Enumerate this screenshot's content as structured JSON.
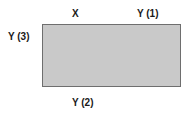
{
  "diagram": {
    "shape": "rectangle",
    "fill_color": "#c9c9c9",
    "border_color": "#6e6e6e",
    "labels": {
      "top_left": "X",
      "top_right": "Y (1)",
      "left": "Y (3)",
      "bottom": "Y (2)"
    }
  }
}
